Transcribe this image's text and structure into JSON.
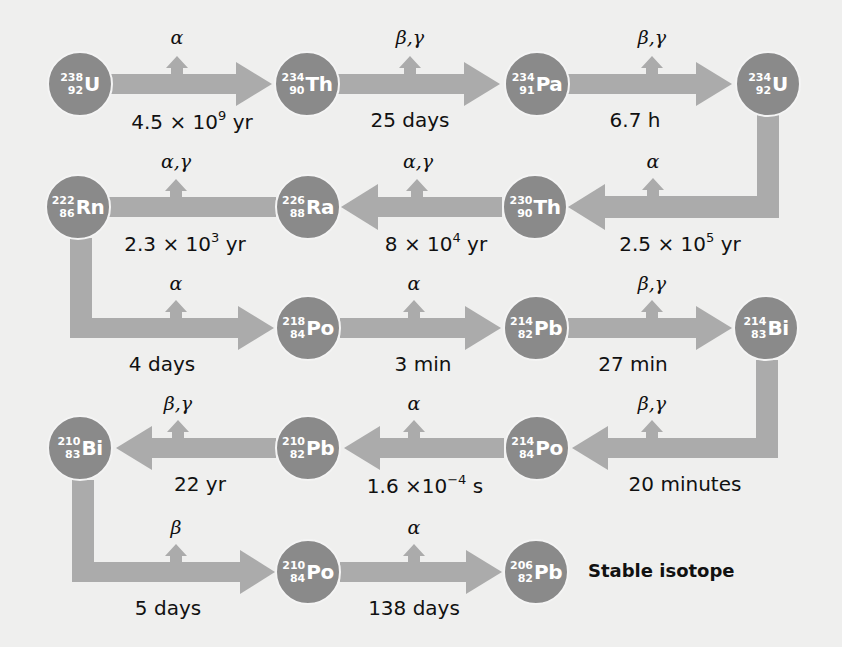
{
  "colors": {
    "background": "#efefee",
    "nuclide": "#8a8a8a",
    "arrow": "#ababab",
    "text": "#111111"
  },
  "nuclides": [
    {
      "id": "U238",
      "symbol": "U",
      "mass": "238",
      "atomic": "92",
      "x": 80,
      "y": 84
    },
    {
      "id": "Th234",
      "symbol": "Th",
      "mass": "234",
      "atomic": "90",
      "x": 307,
      "y": 84
    },
    {
      "id": "Pa234",
      "symbol": "Pa",
      "mass": "234",
      "atomic": "91",
      "x": 537,
      "y": 84
    },
    {
      "id": "U234",
      "symbol": "U",
      "mass": "234",
      "atomic": "92",
      "x": 768,
      "y": 84
    },
    {
      "id": "Th230",
      "symbol": "Th",
      "mass": "230",
      "atomic": "90",
      "x": 535,
      "y": 207
    },
    {
      "id": "Ra226",
      "symbol": "Ra",
      "mass": "226",
      "atomic": "88",
      "x": 308,
      "y": 207
    },
    {
      "id": "Rn222",
      "symbol": "Rn",
      "mass": "222",
      "atomic": "86",
      "x": 78,
      "y": 207
    },
    {
      "id": "Po218",
      "symbol": "Po",
      "mass": "218",
      "atomic": "84",
      "x": 308,
      "y": 328
    },
    {
      "id": "Pb214",
      "symbol": "Pb",
      "mass": "214",
      "atomic": "82",
      "x": 536,
      "y": 328
    },
    {
      "id": "Bi214",
      "symbol": "Bi",
      "mass": "214",
      "atomic": "83",
      "x": 766,
      "y": 328
    },
    {
      "id": "Po214",
      "symbol": "Po",
      "mass": "214",
      "atomic": "84",
      "x": 537,
      "y": 448
    },
    {
      "id": "Pb210",
      "symbol": "Pb",
      "mass": "210",
      "atomic": "82",
      "x": 308,
      "y": 448
    },
    {
      "id": "Bi210",
      "symbol": "Bi",
      "mass": "210",
      "atomic": "83",
      "x": 80,
      "y": 448
    },
    {
      "id": "Po210",
      "symbol": "Po",
      "mass": "210",
      "atomic": "84",
      "x": 308,
      "y": 572
    },
    {
      "id": "Pb206",
      "symbol": "Pb",
      "mass": "206",
      "atomic": "82",
      "x": 536,
      "y": 572
    }
  ],
  "decays": [
    {
      "from": "U238",
      "to": "Th234",
      "emission": "α",
      "halflife": "4.5 × 10",
      "exp": "9",
      "unit": " yr",
      "ex": 177,
      "ey": 26,
      "hx": 192,
      "hy": 108
    },
    {
      "from": "Th234",
      "to": "Pa234",
      "emission": "β,γ",
      "halflife": "25 days",
      "exp": "",
      "unit": "",
      "ex": 410,
      "ey": 26,
      "hx": 410,
      "hy": 108
    },
    {
      "from": "Pa234",
      "to": "U234",
      "emission": "β,γ",
      "halflife": "6.7 h",
      "exp": "",
      "unit": "",
      "ex": 652,
      "ey": 26,
      "hx": 635,
      "hy": 108
    },
    {
      "from": "U234",
      "to": "Th230",
      "emission": "α",
      "halflife": "2.5 × 10",
      "exp": "5",
      "unit": " yr",
      "ex": 653,
      "ey": 150,
      "hx": 680,
      "hy": 230
    },
    {
      "from": "Th230",
      "to": "Ra226",
      "emission": "α,γ",
      "halflife": "8 × 10",
      "exp": "4",
      "unit": " yr",
      "ex": 418,
      "ey": 150,
      "hx": 436,
      "hy": 230
    },
    {
      "from": "Ra226",
      "to": "Rn222",
      "emission": "α,γ",
      "halflife": "2.3 × 10",
      "exp": "3",
      "unit": " yr",
      "ex": 176,
      "ey": 150,
      "hx": 185,
      "hy": 230
    },
    {
      "from": "Rn222",
      "to": "Po218",
      "emission": "α",
      "halflife": "4 days",
      "exp": "",
      "unit": "",
      "ex": 176,
      "ey": 272,
      "hx": 162,
      "hy": 352
    },
    {
      "from": "Po218",
      "to": "Pb214",
      "emission": "α",
      "halflife": "3 min",
      "exp": "",
      "unit": "",
      "ex": 414,
      "ey": 272,
      "hx": 423,
      "hy": 352
    },
    {
      "from": "Pb214",
      "to": "Bi214",
      "emission": "β,γ",
      "halflife": "27 min",
      "exp": "",
      "unit": "",
      "ex": 652,
      "ey": 272,
      "hx": 633,
      "hy": 352
    },
    {
      "from": "Bi214",
      "to": "Po214",
      "emission": "β,γ",
      "halflife": "20 minutes",
      "exp": "",
      "unit": "",
      "ex": 652,
      "ey": 392,
      "hx": 685,
      "hy": 472
    },
    {
      "from": "Po214",
      "to": "Pb210",
      "emission": "α",
      "halflife": "1.6 ×10",
      "exp": "−4",
      "unit": " s",
      "ex": 414,
      "ey": 392,
      "hx": 425,
      "hy": 472
    },
    {
      "from": "Pb210",
      "to": "Bi210",
      "emission": "β,γ",
      "halflife": "22 yr",
      "exp": "",
      "unit": "",
      "ex": 178,
      "ey": 392,
      "hx": 200,
      "hy": 472
    },
    {
      "from": "Bi210",
      "to": "Po210",
      "emission": "β",
      "halflife": "5 days",
      "exp": "",
      "unit": "",
      "ex": 176,
      "ey": 516,
      "hx": 168,
      "hy": 596
    },
    {
      "from": "Po210",
      "to": "Pb206",
      "emission": "α",
      "halflife": "138 days",
      "exp": "",
      "unit": "",
      "ex": 414,
      "ey": 516,
      "hx": 414,
      "hy": 596
    }
  ],
  "stable_label": "Stable isotope"
}
